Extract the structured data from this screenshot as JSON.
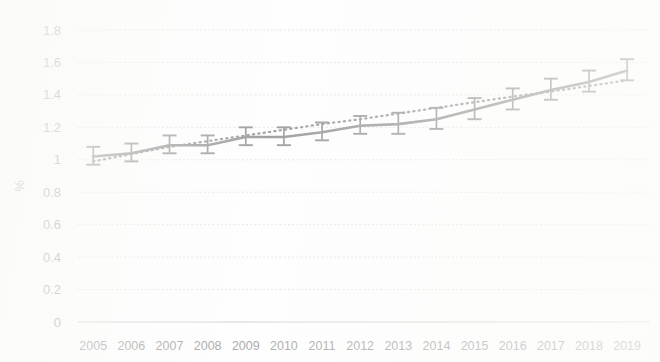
{
  "chart_data": {
    "type": "line",
    "title": "",
    "xlabel": "",
    "ylabel": "%",
    "categories": [
      "2005",
      "2006",
      "2007",
      "2008",
      "2009",
      "2010",
      "2011",
      "2012",
      "2013",
      "2014",
      "2015",
      "2016",
      "2017",
      "2018",
      "2019"
    ],
    "x": [
      2005,
      2006,
      2007,
      2008,
      2009,
      2010,
      2011,
      2012,
      2013,
      2014,
      2015,
      2016,
      2017,
      2018,
      2019
    ],
    "values": [
      1.02,
      1.04,
      1.09,
      1.09,
      1.14,
      1.14,
      1.17,
      1.21,
      1.22,
      1.25,
      1.31,
      1.37,
      1.43,
      1.48,
      1.55
    ],
    "error_upper": [
      1.08,
      1.1,
      1.15,
      1.15,
      1.2,
      1.2,
      1.23,
      1.27,
      1.29,
      1.32,
      1.38,
      1.44,
      1.5,
      1.55,
      1.62
    ],
    "error_lower": [
      0.97,
      0.99,
      1.04,
      1.04,
      1.09,
      1.09,
      1.12,
      1.16,
      1.16,
      1.19,
      1.25,
      1.31,
      1.37,
      1.42,
      1.49
    ],
    "series": [
      {
        "name": "rate",
        "style": "solid",
        "values": [
          1.02,
          1.04,
          1.09,
          1.09,
          1.14,
          1.14,
          1.17,
          1.21,
          1.22,
          1.25,
          1.31,
          1.37,
          1.43,
          1.48,
          1.55
        ]
      },
      {
        "name": "linear-trend",
        "style": "dotted",
        "values": [
          0.99,
          1.035,
          1.08,
          1.115,
          1.15,
          1.185,
          1.22,
          1.25,
          1.285,
          1.32,
          1.355,
          1.39,
          1.42,
          1.455,
          1.49
        ]
      }
    ],
    "ylim": [
      0,
      1.8
    ],
    "yticks": [
      0,
      0.2,
      0.4,
      0.6,
      0.8,
      1,
      1.2,
      1.4,
      1.6,
      1.8
    ],
    "ytick_labels": [
      "0",
      "0.2",
      "0.4",
      "0.6",
      "0.8",
      "1",
      "1.2",
      "1.4",
      "1.6",
      "1.8"
    ],
    "xtick_labels": [
      "2005",
      "2006",
      "2007",
      "2008",
      "2009",
      "2010",
      "2011",
      "2012",
      "2013",
      "2014",
      "2015",
      "2016",
      "2017",
      "2018",
      "2019"
    ],
    "grid": true,
    "legend": false,
    "error_bars": true,
    "colors": {
      "line": "#6e6e6e",
      "trend": "#707070",
      "grid": "#d2d2d2",
      "text": "#7a7a7a",
      "background": "#fdfdfd"
    }
  }
}
